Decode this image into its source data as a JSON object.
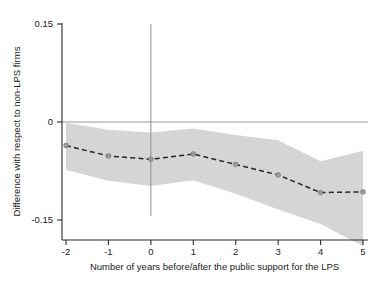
{
  "chart_data": {
    "type": "line",
    "title": "",
    "subtitle": "",
    "xlabel": "Number of years before/after the public support for the LPS",
    "ylabel": "Difference with respect to non-LPS firms",
    "x": [
      -2,
      -1,
      0,
      1,
      2,
      3,
      4,
      5
    ],
    "xticklabels": [
      "-2",
      "-1",
      "0",
      "1",
      "2",
      "3",
      "4",
      "5"
    ],
    "yticklabels": [
      "0.15",
      "0",
      "-0.15"
    ],
    "yticks": [
      0.15,
      0,
      -0.15
    ],
    "xlim": [
      -2,
      5
    ],
    "ylim": [
      -0.15,
      0.15
    ],
    "grid": false,
    "legend": "none",
    "series": [
      {
        "name": "Difference with respect to non-LPS firms",
        "style": "dashed",
        "marker": "circle",
        "color": "#262626",
        "values": [
          -0.036,
          -0.052,
          -0.057,
          -0.049,
          -0.065,
          -0.081,
          -0.108,
          -0.107
        ]
      },
      {
        "name": "Confidence interval upper bound",
        "style": "band-edge",
        "color": "#cfcfcf",
        "values": [
          -0.001,
          -0.012,
          -0.016,
          -0.01,
          -0.02,
          -0.028,
          -0.06,
          -0.044
        ]
      },
      {
        "name": "Confidence interval lower bound",
        "style": "band-edge",
        "color": "#cfcfcf",
        "values": [
          -0.073,
          -0.09,
          -0.098,
          -0.089,
          -0.11,
          -0.134,
          -0.156,
          -0.19
        ]
      }
    ],
    "annotations": [
      {
        "name": "zero-reference-horizontal-line",
        "type": "hline",
        "y": 0
      },
      {
        "name": "event-time-vertical-line",
        "type": "vline",
        "x": 0,
        "y_from": -0.15,
        "y_to": 0.15
      }
    ],
    "colors": {
      "band": "#cfcfcf",
      "line": "#262626",
      "axis": "#2b2b2b",
      "reference": "#9a9a9a",
      "marker_fill": "#9b9b9b",
      "background": "#ffffff"
    }
  }
}
